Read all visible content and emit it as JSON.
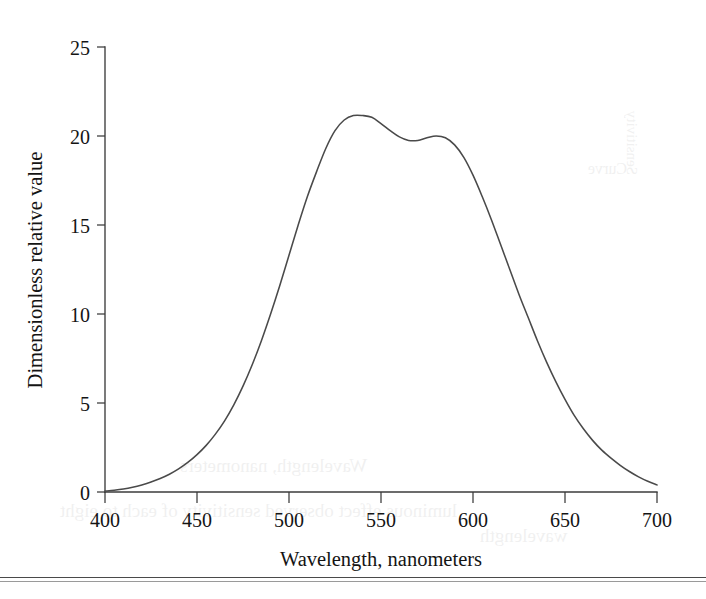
{
  "figure": {
    "background_color": "#ffffff",
    "curve_color": "#4a4a4a",
    "axis_color": "#3b3b3b",
    "text_color": "#141414"
  },
  "axes": {
    "x_title": "Wavelength, nanometers",
    "y_title": "Dimensionless relative value",
    "x_ticks": [
      "400",
      "450",
      "500",
      "550",
      "600",
      "650",
      "700"
    ],
    "y_ticks": [
      "0",
      "5",
      "10",
      "15",
      "20",
      "25"
    ]
  },
  "ghost_text": {
    "a": "Wavelength, nanometers",
    "b": "luminous effect observed sensitivity of each to eight",
    "c": "wavelength",
    "d": "Sensitivity",
    "e": "Curve"
  },
  "chart_data": {
    "type": "line",
    "title": "",
    "subtitle": "",
    "xlabel": "Wavelength, nanometers",
    "ylabel": "Dimensionless relative value",
    "xlim": [
      400,
      700
    ],
    "ylim": [
      0,
      25
    ],
    "xticks": [
      400,
      450,
      500,
      550,
      600,
      650,
      700
    ],
    "yticks": [
      0,
      5,
      10,
      15,
      20,
      25
    ],
    "grid": false,
    "legend": null,
    "series": [
      {
        "name": "Dimensionless relative value",
        "x": [
          400,
          405,
          410,
          415,
          420,
          425,
          430,
          435,
          440,
          445,
          450,
          455,
          460,
          465,
          470,
          475,
          480,
          485,
          490,
          495,
          500,
          505,
          510,
          515,
          520,
          525,
          530,
          535,
          540,
          545,
          550,
          555,
          560,
          565,
          570,
          575,
          580,
          585,
          590,
          595,
          600,
          605,
          610,
          615,
          620,
          625,
          630,
          635,
          640,
          645,
          650,
          655,
          660,
          665,
          670,
          675,
          680,
          685,
          690,
          695,
          700
        ],
        "y": [
          0.05,
          0.1,
          0.17,
          0.27,
          0.4,
          0.56,
          0.76,
          1.0,
          1.3,
          1.66,
          2.1,
          2.62,
          3.25,
          4.0,
          4.9,
          5.95,
          7.15,
          8.5,
          10.0,
          11.6,
          13.3,
          15.0,
          16.6,
          18.0,
          19.3,
          20.3,
          20.9,
          21.15,
          21.15,
          21.05,
          20.7,
          20.3,
          19.95,
          19.75,
          19.75,
          19.9,
          20.0,
          19.9,
          19.5,
          18.8,
          17.8,
          16.6,
          15.3,
          13.9,
          12.5,
          11.1,
          9.8,
          8.5,
          7.3,
          6.2,
          5.2,
          4.3,
          3.55,
          2.9,
          2.35,
          1.9,
          1.5,
          1.15,
          0.85,
          0.6,
          0.4
        ]
      }
    ]
  }
}
